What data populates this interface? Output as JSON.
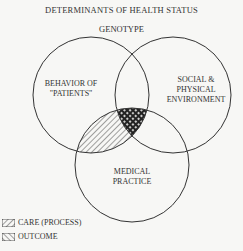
{
  "title": "DETERMINANTS OF HEALTH STATUS",
  "top_label": "GENOTYPE",
  "circles": {
    "left": "BEHAVIOR OF \"PATIENTS\"",
    "left_lines": [
      "BEHAVIOR OF",
      "\"PATIENTS\""
    ],
    "right_lines": [
      "SOCIAL &",
      "PHYSICAL",
      "ENVIRONMENT"
    ],
    "bottom_lines": [
      "MEDICAL",
      "PRACTICE"
    ]
  },
  "legend": [
    {
      "label": "CARE (PROCESS)",
      "pattern": "back-diagonal-hatch"
    },
    {
      "label": "OUTCOME",
      "pattern": "forward-diagonal-hatch"
    }
  ],
  "colors": {
    "line": "#333333",
    "background": "#f7f7f5"
  }
}
